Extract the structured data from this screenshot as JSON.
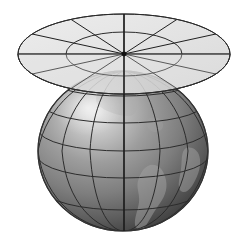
{
  "figure": {
    "title": "Globe with tangent equatorial plane and polar graticule",
    "background_color": "#ffffff",
    "width": 241,
    "height": 240
  },
  "sphere": {
    "name": "globe",
    "center_x": 123,
    "center_y": 151,
    "radius_x": 85,
    "radius_y": 80,
    "fill_light": "#d8d8d8",
    "fill_mid": "#8a8a8a",
    "fill_dark": "#3c3c3c",
    "outline_color": "#3a3a3a",
    "highlight_x": 88,
    "highlight_y": 108,
    "graticule": {
      "line_color": "#2c2c2c",
      "line_width": 1.0,
      "latitude_count": 6,
      "longitude_count": 6,
      "latitude_labels": [
        "75N",
        "60N",
        "45N",
        "30N",
        "15N",
        "0"
      ],
      "longitude_labels": [
        "-90",
        "-60",
        "-30",
        "0",
        "30",
        "60",
        "90"
      ]
    },
    "continents": {
      "fill_color": "#9b9b9b",
      "opacity": 0.55,
      "count": 3,
      "names": [
        "south-america",
        "africa",
        "north-america"
      ]
    }
  },
  "plane": {
    "name": "tangent-disk",
    "center_x": 124,
    "center_y": 54,
    "outer_radius_x": 106,
    "outer_radius_y": 40,
    "inner_radius_x": 58,
    "inner_radius_y": 22,
    "fill_color": "#dddddd",
    "fill_opacity": 0.78,
    "outline_color": "#2b2b2b",
    "outline_width": 1.0,
    "spoke_color": "#1f1f1f",
    "spoke_count": 12,
    "ring_count": 2,
    "spoke_angles_deg": [
      0,
      30,
      60,
      90,
      120,
      150,
      180,
      210,
      240,
      270,
      300,
      330
    ]
  },
  "pole": {
    "name": "north-pole-vertex",
    "x": 124,
    "y": 54,
    "marker_color": "#111111"
  },
  "axis": {
    "name": "polar-axis",
    "x": 124,
    "top_y": 14,
    "bottom_y": 231,
    "color": "#1a1a1a",
    "width": 1.4
  },
  "chart_data": {
    "type": "scatter",
    "title": "Globe with tangent equatorial plane and polar graticule",
    "xlabel": "",
    "ylabel": "",
    "series": [
      {
        "name": "sphere-latitudes",
        "values": [
          75,
          60,
          45,
          30,
          15,
          0
        ]
      },
      {
        "name": "sphere-longitudes",
        "values": [
          -90,
          -60,
          -30,
          0,
          30,
          60,
          90
        ]
      },
      {
        "name": "plane-spokes-deg",
        "values": [
          0,
          30,
          60,
          90,
          120,
          150,
          180,
          210,
          240,
          270,
          300,
          330
        ]
      },
      {
        "name": "plane-rings-radius",
        "values": [
          58,
          106
        ]
      }
    ]
  }
}
